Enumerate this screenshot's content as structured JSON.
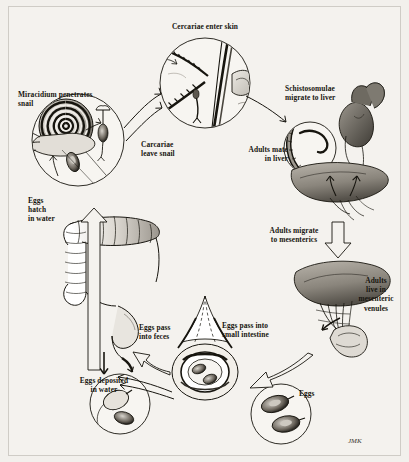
{
  "figure": {
    "background_color": "#f4f2ee",
    "ink_color": "#17150f",
    "signature": "JMK"
  },
  "labels": {
    "cercariae_enter_skin": "Cercariae enter skin",
    "miracidium_penetrates_snail": "Miracidium penetrates\nsnail",
    "carcariae_leave_snail": "Carcariae\nleave snail",
    "schistosomulae_migrate_to_liver": "Schistosomulae\nmigrate to liver",
    "adults_mate_in_liver": "Adults mate\nin liver",
    "adults_migrate_to_mesenterics": "Adults migrate\nto mesenterics",
    "adults_live_in_mesenteric_venules": "Adults\nlive in\nmesenteric\nvenules",
    "eggs_pass_into_small_intestine": "Eggs pass into\nsmall intestine",
    "eggs_pass_into_feces": "Eggs pass\ninto feces",
    "eggs": "Eggs",
    "eggs_deposited_in_water": "Eggs deposited\nin water",
    "eggs_hatch_in_water": "Eggs\nhatch\nin water"
  },
  "stages": [
    {
      "id": "skin",
      "label": "Cercariae enter skin",
      "position": "top-center"
    },
    {
      "id": "schistosomulae",
      "label": "Schistosomulae migrate to liver",
      "position": "upper-right"
    },
    {
      "id": "liver",
      "label": "Adults mate in liver",
      "position": "right"
    },
    {
      "id": "mesenterics",
      "label": "Adults migrate to mesenterics",
      "position": "lower-right"
    },
    {
      "id": "venules",
      "label": "Adults live in mesenteric venules",
      "position": "lower-right"
    },
    {
      "id": "intestine",
      "label": "Eggs pass into small intestine",
      "position": "bottom-center"
    },
    {
      "id": "feces",
      "label": "Eggs pass into feces",
      "position": "bottom-left"
    },
    {
      "id": "water",
      "label": "Eggs deposited in water",
      "position": "bottom-left"
    },
    {
      "id": "hatch",
      "label": "Eggs hatch in water",
      "position": "left"
    },
    {
      "id": "snail",
      "label": "Miracidium penetrates snail",
      "position": "upper-left"
    },
    {
      "id": "leave",
      "label": "Carcariae leave snail",
      "position": "center-left"
    }
  ]
}
